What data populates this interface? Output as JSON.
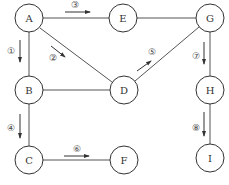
{
  "diagram": {
    "type": "graph-traversal",
    "nodes": [
      {
        "id": "A",
        "label": "A",
        "x": 29,
        "y": 18
      },
      {
        "id": "E",
        "label": "E",
        "x": 123,
        "y": 18
      },
      {
        "id": "G",
        "label": "G",
        "x": 210,
        "y": 18
      },
      {
        "id": "B",
        "label": "B",
        "x": 29,
        "y": 90
      },
      {
        "id": "D",
        "label": "D",
        "x": 124,
        "y": 90
      },
      {
        "id": "H",
        "label": "H",
        "x": 210,
        "y": 90
      },
      {
        "id": "C",
        "label": "C",
        "x": 29,
        "y": 160
      },
      {
        "id": "F",
        "label": "F",
        "x": 124,
        "y": 160
      },
      {
        "id": "I",
        "label": "I",
        "x": 210,
        "y": 158
      }
    ],
    "edges": [
      {
        "from": "A",
        "to": "E"
      },
      {
        "from": "E",
        "to": "G"
      },
      {
        "from": "A",
        "to": "B"
      },
      {
        "from": "A",
        "to": "D"
      },
      {
        "from": "B",
        "to": "D"
      },
      {
        "from": "G",
        "to": "D"
      },
      {
        "from": "G",
        "to": "H"
      },
      {
        "from": "B",
        "to": "C"
      },
      {
        "from": "C",
        "to": "F"
      },
      {
        "from": "H",
        "to": "I"
      }
    ],
    "steps": [
      {
        "label": "①",
        "from": "A",
        "to": "B"
      },
      {
        "label": "②",
        "from": "A",
        "to": "D"
      },
      {
        "label": "③",
        "from": "A",
        "to": "E"
      },
      {
        "label": "④",
        "from": "B",
        "to": "C"
      },
      {
        "label": "⑤",
        "from": "D",
        "to": "G"
      },
      {
        "label": "⑥",
        "from": "C",
        "to": "F"
      },
      {
        "label": "⑦",
        "from": "G",
        "to": "H"
      },
      {
        "label": "⑧",
        "from": "H",
        "to": "I"
      }
    ]
  }
}
